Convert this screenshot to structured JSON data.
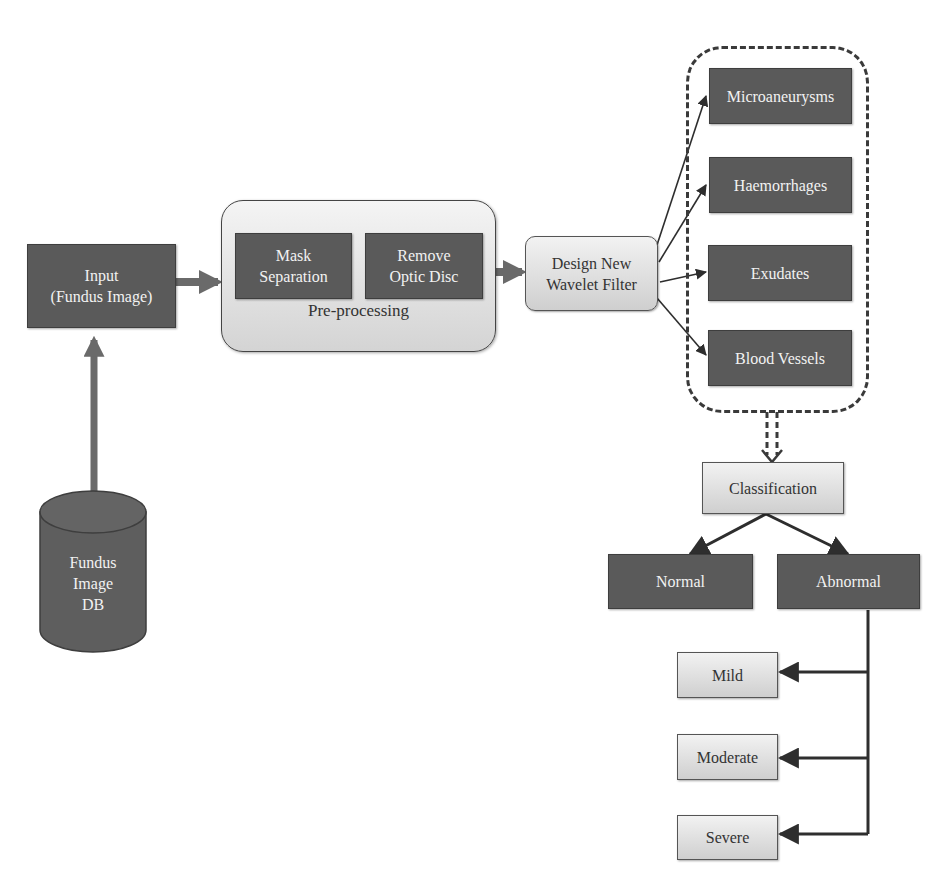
{
  "diagram": {
    "input": {
      "line1": "Input",
      "line2": "(Fundus Image)"
    },
    "database": {
      "line1": "Fundus",
      "line2": "Image",
      "line3": "DB"
    },
    "preprocessing": {
      "label": "Pre-processing",
      "steps": [
        {
          "line1": "Mask",
          "line2": "Separation"
        },
        {
          "line1": "Remove",
          "line2": "Optic Disc"
        }
      ]
    },
    "wavelet": {
      "line1": "Design New",
      "line2": "Wavelet Filter"
    },
    "features": [
      {
        "label": "Microaneurysms"
      },
      {
        "label": "Haemorrhages"
      },
      {
        "label": "Exudates"
      },
      {
        "label": "Blood Vessels"
      }
    ],
    "classification": {
      "label": "Classification"
    },
    "outcomes": [
      {
        "label": "Normal"
      },
      {
        "label": "Abnormal"
      }
    ],
    "severity": [
      {
        "label": "Mild"
      },
      {
        "label": "Moderate"
      },
      {
        "label": "Severe"
      }
    ]
  },
  "colors": {
    "dark_box": "#5a5a5a",
    "light_box_top": "#f2f2f2",
    "light_box_bottom": "#cfcfcf",
    "connector": "#3a3a3a",
    "text_light": "#f2f2f2",
    "text_dark": "#333333"
  }
}
